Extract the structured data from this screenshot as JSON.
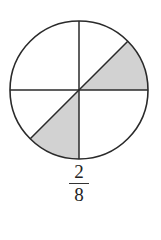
{
  "diagram": {
    "type": "fraction-circle",
    "total_parts": 8,
    "shaded_parts": 2,
    "shaded_sectors_deg": [
      [
        0,
        45
      ],
      [
        225,
        270
      ]
    ],
    "center": [
      79,
      90
    ],
    "radius": 69,
    "shade_color": "#d2d2d2",
    "stroke_color": "#2a2a2a"
  },
  "fraction": {
    "numerator": "2",
    "denominator": "8"
  }
}
